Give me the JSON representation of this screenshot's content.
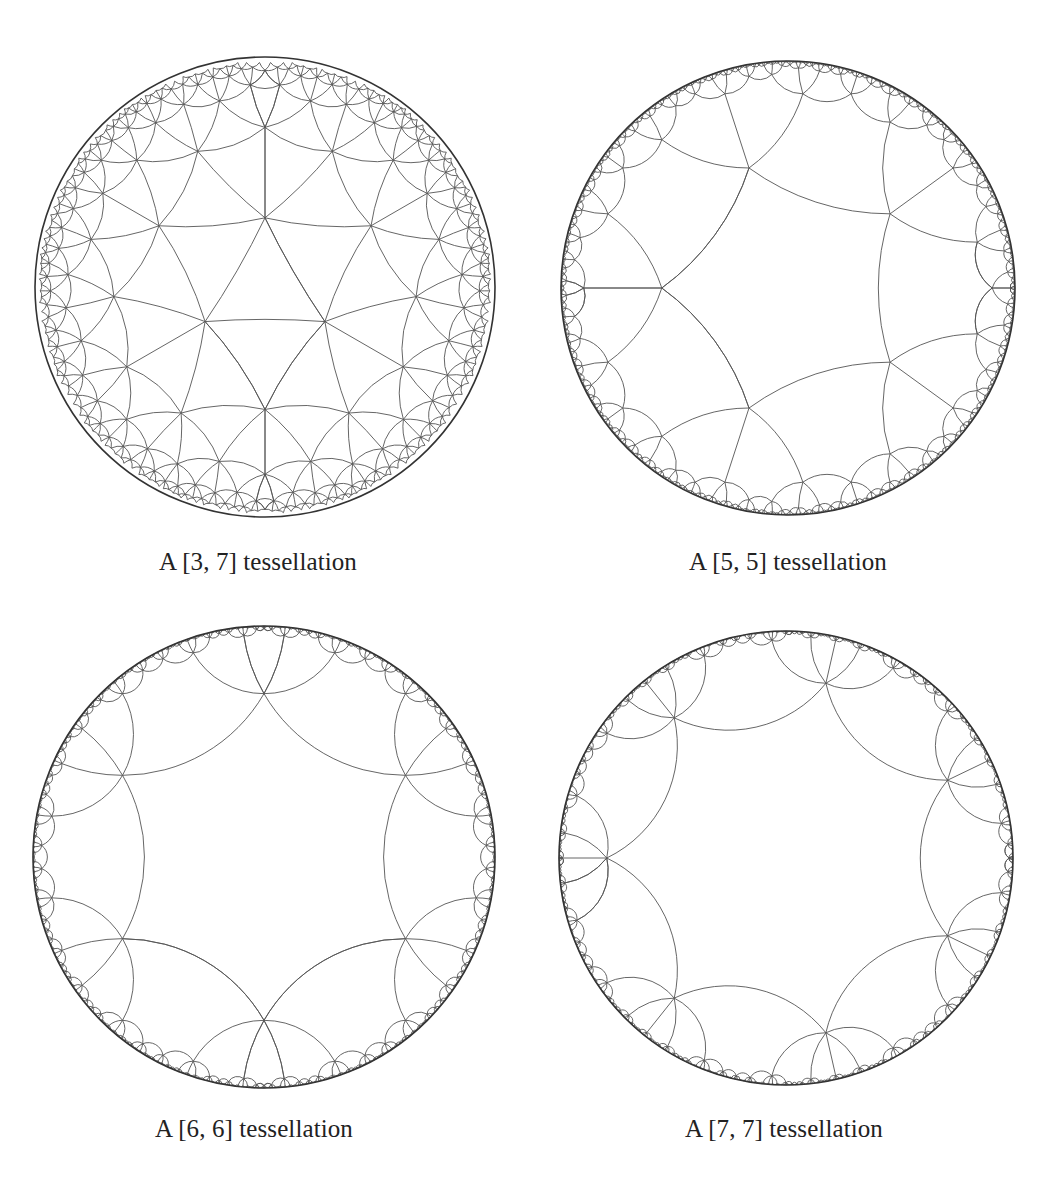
{
  "figures": [
    {
      "id": "fig-3-7",
      "caption": "A [3, 7] tessellation",
      "schlafli": {
        "p": 3,
        "q": 7
      },
      "disk": {
        "cx": 265,
        "cy": 287,
        "r": 230
      },
      "center_type": "face",
      "rotation_deg": 90,
      "caption_pos": {
        "x": 258,
        "y": 548
      }
    },
    {
      "id": "fig-5-5",
      "caption": "A [5, 5] tessellation",
      "schlafli": {
        "p": 5,
        "q": 5
      },
      "disk": {
        "cx": 788,
        "cy": 288,
        "r": 227
      },
      "center_type": "face",
      "rotation_deg": 180,
      "caption_pos": {
        "x": 788,
        "y": 548
      }
    },
    {
      "id": "fig-6-6",
      "caption": "A [6, 6] tessellation",
      "schlafli": {
        "p": 6,
        "q": 6
      },
      "disk": {
        "cx": 264,
        "cy": 857,
        "r": 231
      },
      "center_type": "face",
      "rotation_deg": 90,
      "caption_pos": {
        "x": 254,
        "y": 1115
      }
    },
    {
      "id": "fig-7-7",
      "caption": "A [7, 7] tessellation",
      "schlafli": {
        "p": 7,
        "q": 7
      },
      "disk": {
        "cx": 786,
        "cy": 858,
        "r": 227
      },
      "center_type": "face",
      "rotation_deg": 180,
      "caption_pos": {
        "x": 784,
        "y": 1115
      }
    }
  ],
  "style": {
    "line_color": "#555555",
    "boundary_color": "#333333"
  }
}
